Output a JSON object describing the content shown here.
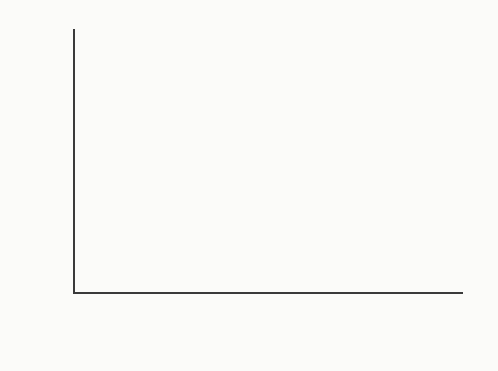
{
  "chart_data": {
    "type": "line",
    "title": "",
    "xlabel": "Age (years)",
    "ylabel": "Number of items",
    "xlim": [
      6,
      17
    ],
    "ylim": [
      8,
      16
    ],
    "xticks": [
      6,
      7,
      8,
      9,
      10,
      11,
      12,
      13,
      14,
      15,
      16,
      17
    ],
    "xtick_labels": [
      "6",
      "7",
      "8",
      "9",
      "10",
      "11",
      "12",
      "13",
      "14",
      "15",
      "16",
      "17"
    ],
    "yticks": [
      8,
      10,
      12,
      14,
      16
    ],
    "ytick_labels": [
      "8",
      "10",
      "12",
      "14",
      "16"
    ],
    "grid": false,
    "legend": "none",
    "x": [
      7,
      9,
      11,
      13,
      14,
      15,
      16.3
    ],
    "series": [
      {
        "name": "open-circle-series",
        "marker": "open-circle",
        "color": "#1e1e1e",
        "values": [
          14.5,
          14.15,
          14.5,
          14.3,
          14.4,
          14.3,
          14.15
        ]
      },
      {
        "name": "filled-square-series",
        "marker": "filled-square",
        "color": "#161616",
        "values": [
          8.5,
          9.95,
          9.55,
          12.9,
          11.65,
          12.5,
          12.0
        ]
      }
    ]
  }
}
